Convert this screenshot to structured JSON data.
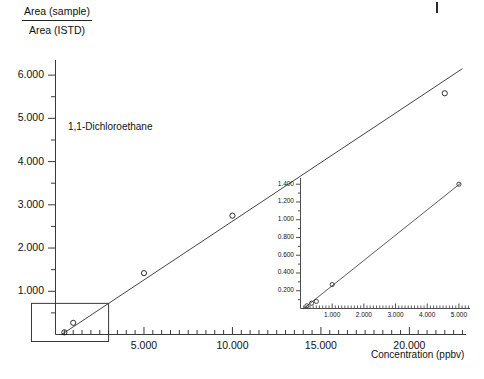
{
  "chart_data": {
    "type": "scatter",
    "title": "",
    "annotation": "1,1-Dichloroethane",
    "xlabel": "Concentration (ppbv)",
    "ylabel_numerator": "Area (sample)",
    "ylabel_denominator": "Area (ISTD)",
    "grid": false,
    "legend": "none",
    "marker": "open-circle",
    "xlim": [
      0,
      23.2
    ],
    "ylim": [
      0,
      6.35
    ],
    "x_ticks_major": [
      5.0,
      10.0,
      15.0,
      20.0
    ],
    "x_tick_labels": [
      "5.000",
      "10.000",
      "15.000",
      "20.000"
    ],
    "x_tick_minor_step": 0.5,
    "y_ticks_major": [
      1.0,
      2.0,
      3.0,
      4.0,
      5.0,
      6.0
    ],
    "y_tick_labels": [
      "1.000",
      "2.000",
      "3.000",
      "4.000",
      "5.000",
      "6.000"
    ],
    "y_tick_minor_step": 0.5,
    "x": [
      0.5,
      1.0,
      5.0,
      10.0,
      22.0
    ],
    "values": [
      0.05,
      0.27,
      1.42,
      2.75,
      5.58
    ],
    "fit_line": {
      "x0": 0.35,
      "y0": 0.0,
      "x1": 23.0,
      "y1": 6.15
    },
    "zoom_box": {
      "x0": 0.0,
      "x1": 3.0,
      "y0": 0.0,
      "y1": 0.72
    }
  },
  "inset_chart_data": {
    "type": "scatter",
    "title": "",
    "xlabel": "",
    "ylabel": "",
    "grid": false,
    "legend": "none",
    "marker": "open-circle",
    "xlim": [
      0,
      5.35
    ],
    "ylim": [
      0,
      1.47
    ],
    "x_ticks_major": [
      1.0,
      2.0,
      3.0,
      4.0,
      5.0
    ],
    "x_tick_labels": [
      "1.000",
      "2.000",
      "3.000",
      "4.000",
      "5.000"
    ],
    "x_tick_minor_step": 0.1,
    "y_ticks_major": [
      0.2,
      0.4,
      0.6,
      0.8,
      1.0,
      1.2,
      1.4
    ],
    "y_tick_labels": [
      "0.200",
      "0.400",
      "0.600",
      "0.800",
      "1.000",
      "1.200",
      "1.400"
    ],
    "y_tick_minor_step": 0.1,
    "x": [
      0.2,
      0.35,
      0.5,
      1.0,
      5.0
    ],
    "values": [
      0.03,
      0.06,
      0.08,
      0.27,
      1.4
    ],
    "fit_line": {
      "x0": 0.1,
      "y0": 0.0,
      "x1": 5.05,
      "y1": 1.41
    }
  },
  "style": {
    "axis_color": "#3a3a3a",
    "line_color": "#2f2f2f",
    "marker_stroke": "#1a1a1a",
    "text_color": "#111111",
    "background": "#ffffff"
  }
}
